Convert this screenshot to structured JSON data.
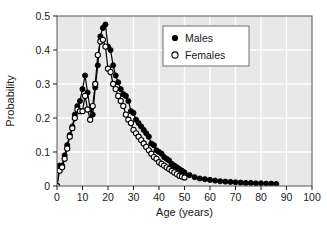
{
  "chart_data": {
    "type": "line",
    "title": "",
    "xlabel": "Age (years)",
    "ylabel": "Probability",
    "xlim": [
      0,
      100
    ],
    "ylim": [
      0,
      0.5
    ],
    "xticks": [
      0,
      10,
      20,
      30,
      40,
      50,
      60,
      70,
      80,
      90,
      100
    ],
    "yticks": [
      0,
      0.1,
      0.2,
      0.3,
      0.4,
      0.5
    ],
    "xtick_labels": [
      "0",
      "10",
      "20",
      "30",
      "40",
      "50",
      "60",
      "70",
      "80",
      "90",
      "100"
    ],
    "ytick_labels": [
      "0",
      "0.1",
      "0.2",
      "0.3",
      "0.4",
      "0.5"
    ],
    "grid": true,
    "grid_color": "#ffffff",
    "plot_bgcolor": "#e8e8e8",
    "legend_position": "upper right",
    "series": [
      {
        "name": "Males",
        "marker": "filled-circle",
        "color": "#000000",
        "x": [
          0,
          1,
          2,
          3,
          4,
          5,
          6,
          7,
          8,
          9,
          10,
          11,
          12,
          13,
          14,
          15,
          16,
          17,
          18,
          19,
          20,
          21,
          22,
          23,
          24,
          25,
          26,
          27,
          28,
          29,
          30,
          31,
          32,
          33,
          34,
          35,
          36,
          37,
          38,
          39,
          40,
          41,
          42,
          43,
          44,
          45,
          46,
          47,
          48,
          49,
          50,
          52,
          54,
          56,
          58,
          60,
          62,
          64,
          66,
          68,
          70,
          72,
          74,
          76,
          78,
          80,
          82,
          84,
          86
        ],
        "y": [
          0.0,
          0.06,
          0.06,
          0.09,
          0.12,
          0.15,
          0.175,
          0.21,
          0.235,
          0.25,
          0.285,
          0.325,
          0.275,
          0.225,
          0.21,
          0.29,
          0.355,
          0.44,
          0.465,
          0.475,
          0.41,
          0.4,
          0.355,
          0.325,
          0.305,
          0.285,
          0.27,
          0.265,
          0.25,
          0.22,
          0.215,
          0.195,
          0.185,
          0.175,
          0.165,
          0.155,
          0.145,
          0.125,
          0.12,
          0.105,
          0.1,
          0.095,
          0.085,
          0.08,
          0.075,
          0.065,
          0.06,
          0.055,
          0.05,
          0.045,
          0.04,
          0.032,
          0.026,
          0.022,
          0.02,
          0.018,
          0.016,
          0.014,
          0.013,
          0.012,
          0.011,
          0.01,
          0.009,
          0.009,
          0.008,
          0.008,
          0.007,
          0.007,
          0.006
        ]
      },
      {
        "name": "Females",
        "marker": "open-circle",
        "color": "#000000",
        "x": [
          0,
          1,
          2,
          3,
          4,
          5,
          6,
          7,
          8,
          9,
          10,
          11,
          12,
          13,
          14,
          15,
          16,
          17,
          18,
          19,
          20,
          21,
          22,
          23,
          24,
          25,
          26,
          27,
          28,
          29,
          30,
          31,
          32,
          33,
          34,
          35,
          36,
          37,
          38,
          39,
          40,
          41,
          42,
          43,
          44,
          45,
          46,
          47,
          48,
          49,
          50
        ],
        "y": [
          0.0,
          0.045,
          0.055,
          0.08,
          0.11,
          0.145,
          0.17,
          0.2,
          0.225,
          0.22,
          0.22,
          0.265,
          0.225,
          0.195,
          0.235,
          0.3,
          0.385,
          0.425,
          0.43,
          0.41,
          0.345,
          0.335,
          0.3,
          0.285,
          0.265,
          0.25,
          0.235,
          0.21,
          0.195,
          0.185,
          0.165,
          0.155,
          0.145,
          0.135,
          0.125,
          0.115,
          0.105,
          0.095,
          0.085,
          0.08,
          0.07,
          0.065,
          0.06,
          0.055,
          0.05,
          0.045,
          0.04,
          0.035,
          0.03,
          0.028,
          0.025
        ]
      }
    ]
  },
  "legend": {
    "entries": [
      {
        "label": "Males",
        "marker": "filled-circle"
      },
      {
        "label": "Females",
        "marker": "open-circle"
      }
    ]
  }
}
